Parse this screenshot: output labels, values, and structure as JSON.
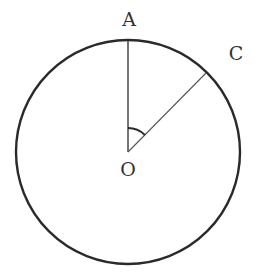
{
  "diagram": {
    "title": "",
    "colors": {
      "circle": "#2a2a2a",
      "radius_OA": "#2a2a2a",
      "radius_OC": "#555555",
      "angle_arc": "#2a2a2a",
      "label": "#333333",
      "background": "#ffffff"
    },
    "circle": {
      "center": "O",
      "cx": 128,
      "cy": 152,
      "r": 112
    },
    "points": [
      {
        "id": "A",
        "label": "A",
        "x": 128,
        "y": 40,
        "label_x": 129,
        "label_y": 26
      },
      {
        "id": "C",
        "label": "C",
        "x": 206,
        "y": 73,
        "label_x": 236,
        "label_y": 60
      },
      {
        "id": "O",
        "label": "O",
        "x": 128,
        "y": 152,
        "label_x": 128,
        "label_y": 176
      }
    ],
    "segments": [
      {
        "from": "O",
        "to": "A"
      },
      {
        "from": "O",
        "to": "C"
      }
    ],
    "angles": [
      {
        "vertex": "O",
        "between": [
          "A",
          "C"
        ],
        "marked": true
      }
    ],
    "labels": {
      "A": "A",
      "C": "C",
      "O": "O"
    }
  }
}
